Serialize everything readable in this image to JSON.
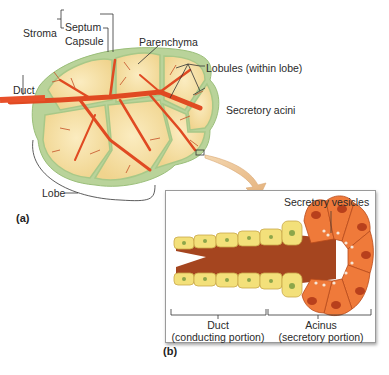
{
  "figure": {
    "panel_a": {
      "label": "(a)",
      "labels": {
        "stroma": "Stroma",
        "septum": "Septum",
        "capsule": "Capsule",
        "parenchyma": "Parenchyma",
        "lobules": "Lobules (within lobe)",
        "secretory_acini": "Secretory acini",
        "duct": "Duct",
        "lobe": "Lobe"
      }
    },
    "panel_b": {
      "label": "(b)",
      "labels": {
        "secretory_vesicles": "Secretory vesicles",
        "duct_title": "Duct",
        "duct_sub": "(conducting portion)",
        "acinus_title": "Acinus",
        "acinus_sub": "(secretory portion)"
      }
    },
    "colors": {
      "capsule_green": "#b9d39a",
      "lobule_fill": "#f7e2a8",
      "duct_orange": "#e8502a",
      "acinus_orange": "#ef7a3a",
      "duct_cell_yellow": "#f3e07a",
      "arrow_tan": "#edc89a"
    }
  }
}
